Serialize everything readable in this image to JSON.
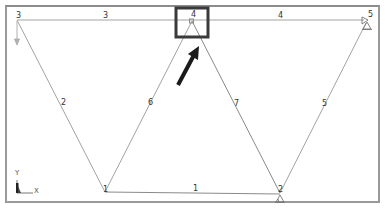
{
  "diagram": {
    "type": "truss-model",
    "nodes": [
      {
        "id": "1",
        "label": "1",
        "x": 105,
        "y": 192
      },
      {
        "id": "2",
        "label": "2",
        "x": 280,
        "y": 193
      },
      {
        "id": "3",
        "label": "3",
        "x": 17,
        "y": 20
      },
      {
        "id": "4",
        "label": "4",
        "x": 192,
        "y": 20
      },
      {
        "id": "5",
        "label": "5",
        "x": 367,
        "y": 20
      }
    ],
    "elements": [
      {
        "id": "1",
        "label": "1",
        "from": "1",
        "to": "2"
      },
      {
        "id": "2",
        "label": "2",
        "from": "3",
        "to": "1"
      },
      {
        "id": "3",
        "label": "3",
        "from": "3",
        "to": "4"
      },
      {
        "id": "4",
        "label": "4",
        "from": "4",
        "to": "5"
      },
      {
        "id": "5",
        "label": "5",
        "from": "5",
        "to": "2"
      },
      {
        "id": "6",
        "label": "6",
        "from": "1",
        "to": "4"
      },
      {
        "id": "7",
        "label": "7",
        "from": "4",
        "to": "2"
      }
    ],
    "supports": [
      {
        "node": "5",
        "type": "pin"
      },
      {
        "node": "2",
        "type": "pin"
      }
    ],
    "loads": [
      {
        "node": "3",
        "direction": "down"
      }
    ],
    "highlight": {
      "node": "4",
      "color": "#3a3a3a"
    },
    "pointer_arrow": {
      "target": "node-4",
      "color": "#1a1a1a"
    },
    "axes": {
      "x_label": "X",
      "y_label": "Y"
    },
    "colors": {
      "frame": "#9a9a9a",
      "element_line": "#a0a0a0",
      "label": "#333333"
    }
  }
}
